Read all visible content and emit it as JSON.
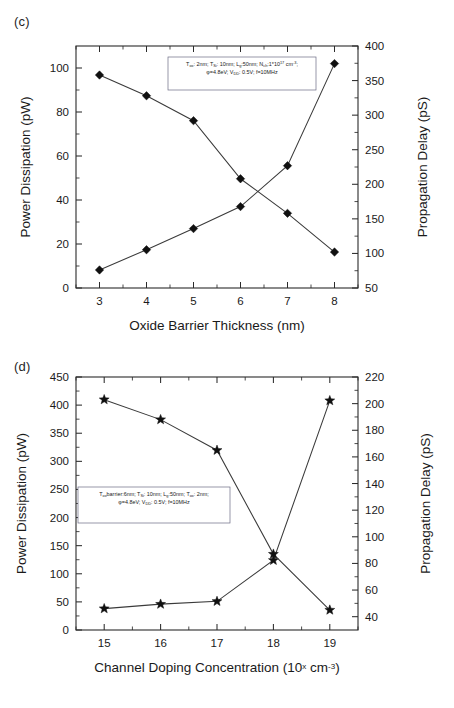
{
  "figure": {
    "panels": [
      {
        "tag": "(c)",
        "xlabel": "Oxide Barrier Thickness (nm)",
        "ylabel_left": "Power Dissipation (pW)",
        "ylabel_right": "Propagation Delay (pS)",
        "annotation_line1_parts": [
          {
            "t": "T",
            "k": "n"
          },
          {
            "t": "ox",
            "k": "sub"
          },
          {
            "t": ": 2nm; T",
            "k": "n"
          },
          {
            "t": "Si",
            "k": "sub"
          },
          {
            "t": ": 10nm; L",
            "k": "n"
          },
          {
            "t": "g",
            "k": "sub"
          },
          {
            "t": ":50nm; N",
            "k": "n"
          },
          {
            "t": "ch",
            "k": "sub"
          },
          {
            "t": ":1*10",
            "k": "n"
          },
          {
            "t": "17",
            "k": "sup"
          },
          {
            "t": " cm",
            "k": "n"
          },
          {
            "t": "-3",
            "k": "sup"
          },
          {
            "t": ";",
            "k": "n"
          }
        ],
        "annotation_line2_parts": [
          {
            "t": "φ=4.8eV; V",
            "k": "n"
          },
          {
            "t": "DD",
            "k": "sub"
          },
          {
            "t": ": 0.5V; f=10MHz",
            "k": "n"
          }
        ]
      },
      {
        "tag": "(d)",
        "xlabel_parts": [
          {
            "t": "Channel Doping Concentration (10",
            "k": "n"
          },
          {
            "t": "x",
            "k": "sup"
          },
          {
            "t": " cm",
            "k": "n"
          },
          {
            "t": "-3",
            "k": "sup"
          },
          {
            "t": ")",
            "k": "n"
          }
        ],
        "ylabel_left": "Power Dissipation (pW)",
        "ylabel_right": "Propagation Delay (pS)",
        "annotation_line1_parts": [
          {
            "t": "T",
            "k": "n"
          },
          {
            "t": "ox",
            "k": "sub"
          },
          {
            "t": "barrier:6nm; T",
            "k": "n"
          },
          {
            "t": "Si",
            "k": "sub"
          },
          {
            "t": ": 10nm; L",
            "k": "n"
          },
          {
            "t": "g",
            "k": "sub"
          },
          {
            "t": ":50nm; T",
            "k": "n"
          },
          {
            "t": "ox",
            "k": "sub"
          },
          {
            "t": ": 2nm;",
            "k": "n"
          }
        ],
        "annotation_line2_parts": [
          {
            "t": "φ=4.8eV; V",
            "k": "n"
          },
          {
            "t": "DD",
            "k": "sub"
          },
          {
            "t": ": 0.5V; f=10MHz",
            "k": "n"
          }
        ]
      }
    ]
  },
  "chart_data": [
    {
      "type": "line",
      "panel": "(c)",
      "title": "",
      "xlabel": "Oxide Barrier Thickness (nm)",
      "ylabel": "Power Dissipation (pW)",
      "ylabel_right": "Propagation Delay (pS)",
      "x": [
        3,
        4,
        5,
        6,
        7,
        8
      ],
      "xlim": [
        2.5,
        8.5
      ],
      "xticks": [
        3,
        4,
        5,
        6,
        7,
        8
      ],
      "ylim": [
        0,
        110
      ],
      "yticks": [
        0,
        20,
        40,
        60,
        80,
        100
      ],
      "ylim_right": [
        50,
        400
      ],
      "yticks_right": [
        50,
        100,
        150,
        200,
        250,
        300,
        350,
        400
      ],
      "grid": false,
      "legend": "none",
      "series": [
        {
          "name": "Power Dissipation",
          "axis": "left",
          "marker": "diamond",
          "values": [
            8.2,
            17.4,
            27.0,
            37.0,
            55.6,
            102.0
          ]
        },
        {
          "name": "Propagation Delay",
          "axis": "right",
          "marker": "diamond",
          "values": [
            358,
            328,
            292,
            208,
            158,
            102
          ]
        }
      ]
    },
    {
      "type": "line",
      "panel": "(d)",
      "title": "",
      "xlabel": "Channel Doping Concentration (10^x cm^-3)",
      "ylabel": "Power Dissipation (pW)",
      "ylabel_right": "Propagation Delay (pS)",
      "x": [
        15,
        16,
        17,
        18,
        19
      ],
      "xlim": [
        14.5,
        19.5
      ],
      "xticks": [
        15,
        16,
        17,
        18,
        19
      ],
      "ylim": [
        0,
        450
      ],
      "yticks": [
        0,
        50,
        100,
        150,
        200,
        250,
        300,
        350,
        400,
        450
      ],
      "ylim_right": [
        30,
        220
      ],
      "yticks_right": [
        40,
        60,
        80,
        100,
        120,
        140,
        160,
        180,
        200,
        220
      ],
      "grid": false,
      "legend": "none",
      "series": [
        {
          "name": "Power Dissipation",
          "axis": "left",
          "marker": "star",
          "values": [
            38,
            46,
            51,
            124,
            408
          ]
        },
        {
          "name": "Propagation Delay",
          "axis": "right",
          "marker": "star",
          "values": [
            203,
            188,
            165,
            87,
            45
          ]
        }
      ]
    }
  ]
}
